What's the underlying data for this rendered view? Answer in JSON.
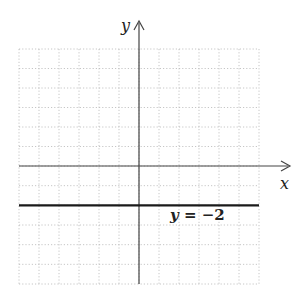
{
  "chart_data": {
    "type": "line",
    "title": "",
    "xlabel": "x",
    "ylabel": "y",
    "xlim": [
      -6,
      6
    ],
    "ylim": [
      -6,
      6
    ],
    "grid": true,
    "tick_labels": false,
    "series": [
      {
        "name": "y = −2",
        "equation": "y = -2",
        "x": [
          -6,
          6
        ],
        "y": [
          -2,
          -2
        ]
      }
    ],
    "annotations": [
      {
        "text": "y = −2",
        "x": 3,
        "y": -2.6
      }
    ]
  },
  "labels": {
    "x_axis": "x",
    "y_axis": "y",
    "equation_var": "y",
    "equation_rest": " = −2"
  }
}
